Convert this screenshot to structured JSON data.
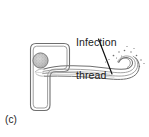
{
  "figure": {
    "panel_label": "(c)",
    "annotation": {
      "line1": "Infection",
      "line2": "thread",
      "full_text": "Infection thread"
    },
    "parts": {
      "cell_name": "root-hair-cell",
      "nucleus_name": "nucleus",
      "thread_name": "infection-thread",
      "bacteria_name": "bacteria-dots"
    },
    "colors": {
      "outline": "#6b6b6b",
      "outline_dark": "#4a4a4a",
      "text": "#1a1a1a",
      "nucleus_fill": "#bdbdbd",
      "nucleus_stipple": "#777777",
      "background": "#ffffff",
      "leader": "#111111"
    }
  }
}
